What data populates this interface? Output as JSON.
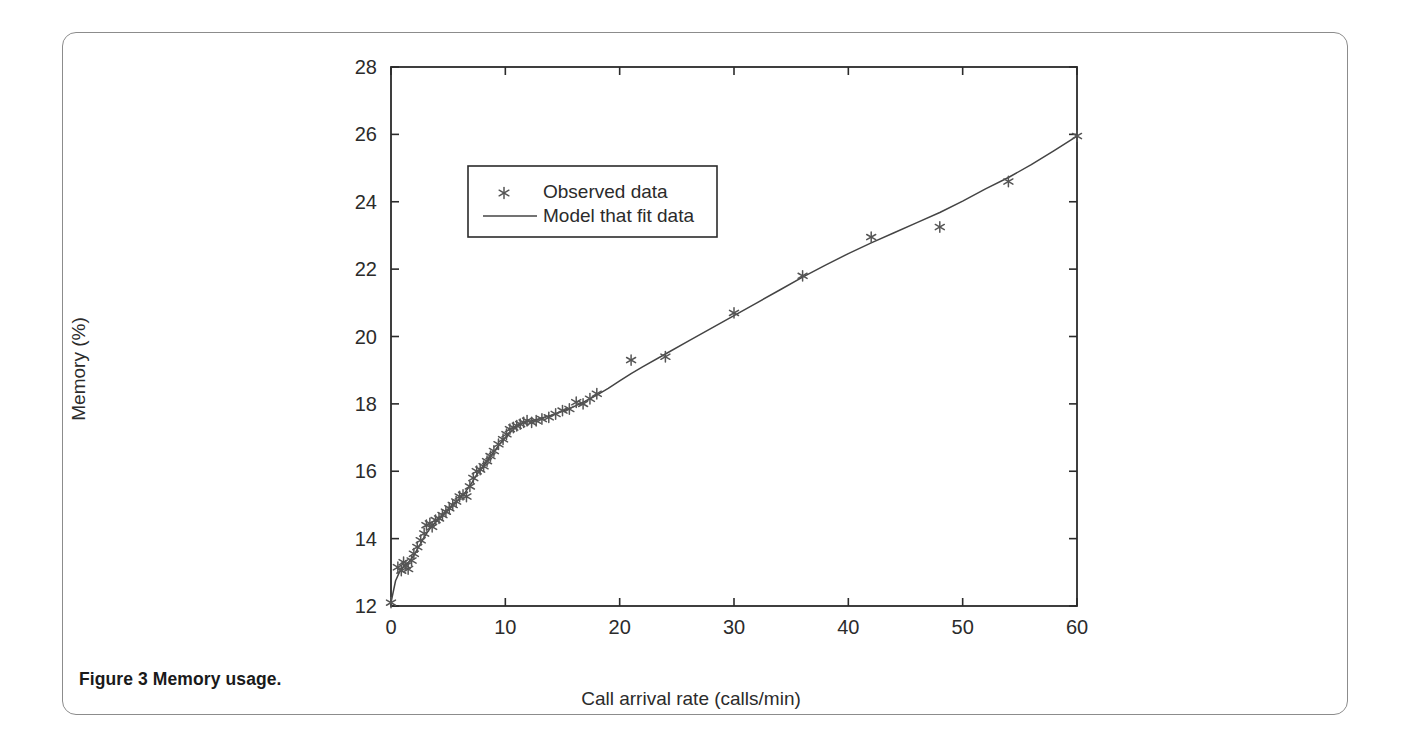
{
  "figure": {
    "caption_label": "Figure 3",
    "caption_text": "Memory usage."
  },
  "chart_data": {
    "type": "scatter",
    "title": "",
    "xlabel": "Call arrival rate (calls/min)",
    "ylabel": "Memory (%)",
    "xlim": [
      0,
      60
    ],
    "ylim": [
      12,
      28
    ],
    "xticks": [
      0,
      10,
      20,
      30,
      40,
      50,
      60
    ],
    "yticks": [
      12,
      14,
      16,
      18,
      20,
      22,
      24,
      26,
      28
    ],
    "xtick_labels": [
      "0",
      "10",
      "20",
      "30",
      "40",
      "50",
      "60"
    ],
    "ytick_labels": [
      "12",
      "14",
      "16",
      "18",
      "20",
      "22",
      "24",
      "26",
      "28"
    ],
    "grid": false,
    "legend_position": "upper-left-inset",
    "legend": [
      {
        "label": "Observed data",
        "marker": "star",
        "style": "marker"
      },
      {
        "label": "Model that fit data",
        "marker": "line",
        "style": "line"
      }
    ],
    "series": [
      {
        "name": "Observed data",
        "type": "scatter",
        "marker": "star",
        "color": "#555555",
        "points": [
          [
            0.0,
            12.1
          ],
          [
            0.6,
            13.15
          ],
          [
            0.9,
            13.05
          ],
          [
            1.1,
            13.3
          ],
          [
            1.3,
            13.2
          ],
          [
            1.5,
            13.1
          ],
          [
            1.8,
            13.35
          ],
          [
            2.0,
            13.55
          ],
          [
            2.3,
            13.75
          ],
          [
            2.6,
            13.95
          ],
          [
            2.9,
            14.15
          ],
          [
            3.1,
            14.4
          ],
          [
            3.4,
            14.45
          ],
          [
            3.6,
            14.35
          ],
          [
            3.9,
            14.55
          ],
          [
            4.2,
            14.6
          ],
          [
            4.5,
            14.7
          ],
          [
            4.8,
            14.8
          ],
          [
            5.1,
            14.9
          ],
          [
            5.4,
            15.0
          ],
          [
            5.7,
            15.1
          ],
          [
            6.0,
            15.25
          ],
          [
            6.3,
            15.3
          ],
          [
            6.6,
            15.25
          ],
          [
            6.9,
            15.55
          ],
          [
            7.2,
            15.8
          ],
          [
            7.5,
            16.0
          ],
          [
            7.8,
            16.05
          ],
          [
            8.1,
            16.15
          ],
          [
            8.4,
            16.3
          ],
          [
            8.7,
            16.45
          ],
          [
            9.0,
            16.6
          ],
          [
            9.4,
            16.8
          ],
          [
            9.8,
            16.95
          ],
          [
            10.1,
            17.1
          ],
          [
            10.4,
            17.25
          ],
          [
            10.7,
            17.3
          ],
          [
            11.0,
            17.35
          ],
          [
            11.3,
            17.4
          ],
          [
            11.6,
            17.45
          ],
          [
            11.9,
            17.5
          ],
          [
            12.3,
            17.45
          ],
          [
            12.7,
            17.5
          ],
          [
            13.2,
            17.55
          ],
          [
            13.8,
            17.6
          ],
          [
            14.4,
            17.7
          ],
          [
            15.0,
            17.8
          ],
          [
            15.6,
            17.85
          ],
          [
            16.2,
            18.05
          ],
          [
            16.8,
            18.0
          ],
          [
            17.4,
            18.15
          ],
          [
            18.0,
            18.3
          ],
          [
            21.0,
            19.3
          ],
          [
            24.0,
            19.4
          ],
          [
            30.0,
            20.7
          ],
          [
            36.0,
            21.8
          ],
          [
            42.0,
            22.95
          ],
          [
            48.0,
            23.25
          ],
          [
            54.0,
            24.6
          ],
          [
            60.0,
            25.95
          ]
        ]
      },
      {
        "name": "Model that fit data",
        "type": "line",
        "color": "#444444",
        "points": [
          [
            0.0,
            12.1
          ],
          [
            0.4,
            12.75
          ],
          [
            0.8,
            13.05
          ],
          [
            1.2,
            13.2
          ],
          [
            1.6,
            13.32
          ],
          [
            2.0,
            13.5
          ],
          [
            2.5,
            13.8
          ],
          [
            3.0,
            14.1
          ],
          [
            3.5,
            14.35
          ],
          [
            4.0,
            14.52
          ],
          [
            4.5,
            14.68
          ],
          [
            5.0,
            14.85
          ],
          [
            5.5,
            15.02
          ],
          [
            6.0,
            15.2
          ],
          [
            6.5,
            15.38
          ],
          [
            7.0,
            15.62
          ],
          [
            7.5,
            15.9
          ],
          [
            8.0,
            16.12
          ],
          [
            8.5,
            16.35
          ],
          [
            9.0,
            16.58
          ],
          [
            9.5,
            16.8
          ],
          [
            10.0,
            17.0
          ],
          [
            10.5,
            17.18
          ],
          [
            11.0,
            17.32
          ],
          [
            11.5,
            17.42
          ],
          [
            12.0,
            17.48
          ],
          [
            13.0,
            17.56
          ],
          [
            14.0,
            17.66
          ],
          [
            15.0,
            17.78
          ],
          [
            16.0,
            17.92
          ],
          [
            17.0,
            18.08
          ],
          [
            18.0,
            18.26
          ],
          [
            19.0,
            18.46
          ],
          [
            20.0,
            18.68
          ],
          [
            21.0,
            18.9
          ],
          [
            22.0,
            19.1
          ],
          [
            24.0,
            19.48
          ],
          [
            26.0,
            19.86
          ],
          [
            28.0,
            20.24
          ],
          [
            30.0,
            20.62
          ],
          [
            32.0,
            21.0
          ],
          [
            34.0,
            21.38
          ],
          [
            36.0,
            21.76
          ],
          [
            38.0,
            22.12
          ],
          [
            40.0,
            22.46
          ],
          [
            42.0,
            22.78
          ],
          [
            44.0,
            23.08
          ],
          [
            46.0,
            23.38
          ],
          [
            48.0,
            23.68
          ],
          [
            50.0,
            24.02
          ],
          [
            52.0,
            24.38
          ],
          [
            54.0,
            24.72
          ],
          [
            56.0,
            25.1
          ],
          [
            58.0,
            25.52
          ],
          [
            60.0,
            25.95
          ]
        ]
      }
    ]
  }
}
